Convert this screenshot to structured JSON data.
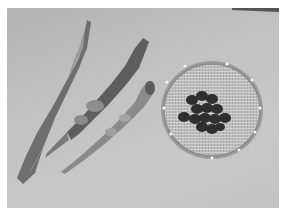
{
  "image": {
    "description": "Grayscale photograph of three dried bean pods lying diagonally on a cloth, beside a round woven basket holding a cluster of dark beans",
    "subjects": [
      "bean-pod",
      "bean-pod",
      "bean-pod",
      "woven-basket",
      "dark-beans"
    ],
    "palette": {
      "background": "#c2c2c2",
      "pod_dark": "#5a5a5a",
      "pod_mid": "#8a8a8a",
      "basket": "#b8b8b8",
      "beans": "#2e2e2e",
      "border": "#ffffff"
    }
  }
}
